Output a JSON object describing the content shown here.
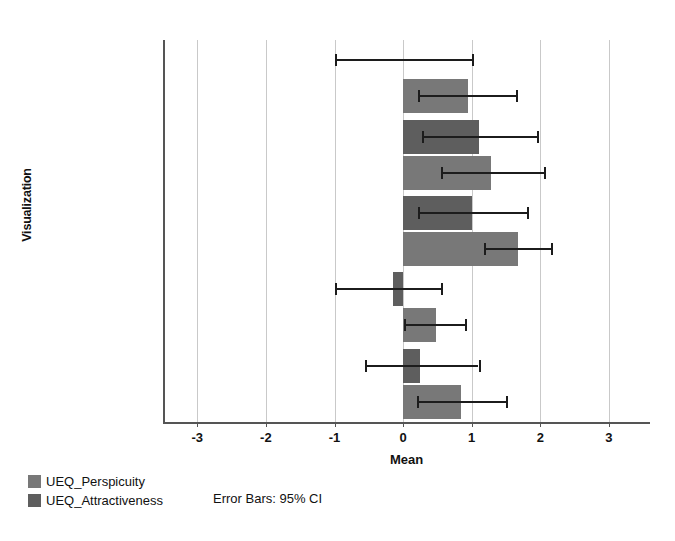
{
  "chart_data": {
    "type": "bar",
    "orientation": "horizontal",
    "title": "",
    "xlabel": "Mean",
    "ylabel": "Visualization",
    "xlim": [
      -3.5,
      3.6
    ],
    "xticks": [
      -3,
      -2,
      -1,
      0,
      1,
      2,
      3
    ],
    "xticklabels": [
      "-3",
      "-2",
      "-1",
      "0",
      "1",
      "2",
      "3"
    ],
    "grid": "vertical",
    "categories": [
      "Tube max",
      "Boomerang",
      "Conventional",
      "Lines",
      "Tube min"
    ],
    "legend_position": "below-left",
    "annotation": "Error Bars: 95% CI",
    "series": [
      {
        "name": "UEQ_Attractiveness",
        "color": "#5e5e5e",
        "values": [
          0.0,
          1.1,
          1.0,
          -0.15,
          0.25
        ],
        "ci_low": [
          -1.0,
          0.28,
          0.22,
          -1.0,
          -0.55
        ],
        "ci_high": [
          1.0,
          1.95,
          1.8,
          0.55,
          1.1
        ]
      },
      {
        "name": "UEQ_Perspicuity",
        "color": "#787878",
        "values": [
          0.95,
          1.28,
          1.67,
          0.48,
          0.85
        ],
        "ci_low": [
          0.22,
          0.55,
          1.18,
          0.02,
          0.2
        ],
        "ci_high": [
          1.65,
          2.05,
          2.15,
          0.9,
          1.5
        ]
      }
    ]
  },
  "axes": {
    "x_title": "Mean",
    "y_title": "Visualization",
    "x_tick_labels": [
      "-3",
      "-2",
      "-1",
      "0",
      "1",
      "2",
      "3"
    ],
    "y_tick_labels": [
      "Tube max",
      "Boomerang",
      "Conventional",
      "Lines",
      "Tube min"
    ]
  },
  "legend": {
    "items": [
      {
        "label": "UEQ_Perspicuity",
        "color": "#787878"
      },
      {
        "label": "UEQ_Attractiveness",
        "color": "#5e5e5e"
      }
    ]
  },
  "notes": {
    "error_bars": "Error Bars: 95% CI"
  }
}
